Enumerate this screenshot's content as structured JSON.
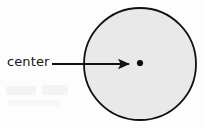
{
  "figure": {
    "type": "geometry-diagram",
    "width": 204,
    "height": 128,
    "background_color": "#fdfdfd"
  },
  "annotations": {
    "center_label": "center"
  },
  "shapes": {
    "circle": {
      "name": "circle",
      "cx": 140,
      "cy": 64,
      "r": 56,
      "fill_color": "#e9e9e9",
      "stroke_color": "#111111",
      "stroke_width": 1.8
    },
    "center_point": {
      "name": "center-point",
      "cx": 140,
      "cy": 63,
      "r": 3.1,
      "fill_color": "#0d0d0d"
    },
    "arrow": {
      "name": "pointer-arrow",
      "x1": 52,
      "y1": 64,
      "x2": 133,
      "y2": 64,
      "stroke_color": "#121212",
      "stroke_width": 1.8,
      "head_length": 11,
      "head_width": 8
    }
  }
}
